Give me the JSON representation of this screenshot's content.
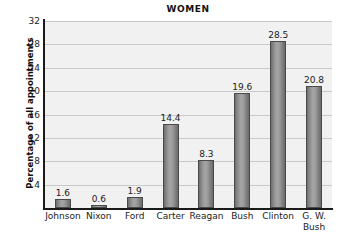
{
  "chart_data": {
    "type": "bar",
    "title": "WOMEN",
    "xlabel": "",
    "ylabel": "Percentage of all appointments",
    "categories": [
      "Johnson",
      "Nixon",
      "Ford",
      "Carter",
      "Reagan",
      "Bush",
      "Clinton",
      "G. W. Bush"
    ],
    "category_lines": [
      [
        "Johnson"
      ],
      [
        "Nixon"
      ],
      [
        "Ford"
      ],
      [
        "Carter"
      ],
      [
        "Reagan"
      ],
      [
        "Bush"
      ],
      [
        "Clinton"
      ],
      [
        "G. W.",
        "Bush"
      ]
    ],
    "values": [
      1.6,
      0.6,
      1.9,
      14.4,
      8.3,
      19.6,
      28.5,
      20.8
    ],
    "value_labels": [
      "1.6",
      "0.6",
      "1.9",
      "14.4",
      "8.3",
      "19.6",
      "28.5",
      "20.8"
    ],
    "ylim": [
      0,
      32
    ],
    "yticks": [
      4,
      8,
      12,
      16,
      20,
      24,
      28,
      32
    ],
    "ytick_labels": [
      "4",
      "8",
      "12",
      "16",
      "20",
      "24",
      "28",
      "32"
    ],
    "grid": true,
    "grid_axis": "y",
    "legend": false,
    "colors": {
      "bar_fill_light": "#a6a6a6",
      "bar_fill_dark": "#6a6a6a",
      "bar_edge": "#4a4a4a",
      "plot_background": "#f1f1f1",
      "gridline": "#c9c9c9",
      "axis": "#1a1a1a",
      "text": "#1a1a1a",
      "figure_background": "#ffffff"
    }
  }
}
